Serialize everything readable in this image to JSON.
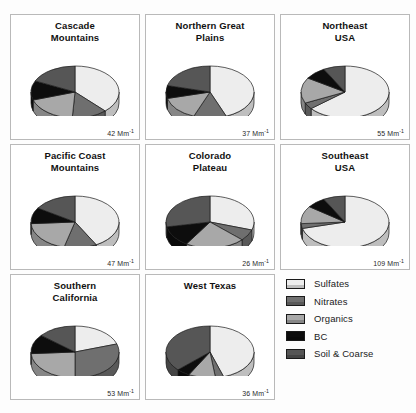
{
  "figure": {
    "kind": "small-multiples-3d-pie-grid",
    "background": "#fdfdfd",
    "columns": 3,
    "rows": 3,
    "unit_label": "Mm",
    "unit_exponent": "-1"
  },
  "legend": {
    "position": "bottom-right",
    "entries": [
      {
        "label": "Sulfates",
        "color": "#ededed"
      },
      {
        "label": "Nitrates",
        "color": "#6f6f6f"
      },
      {
        "label": "Organics",
        "color": "#a8a8a8"
      },
      {
        "label": "BC",
        "color": "#0d0d0d"
      },
      {
        "label": "Soil & Coarse",
        "color": "#565656"
      }
    ]
  },
  "chart_data": {
    "type": "pie",
    "title": "",
    "legend_position": "bottom-right",
    "series_names": [
      "Sulfates",
      "Nitrates",
      "Organics",
      "BC",
      "Soil & Coarse"
    ],
    "series_colors": [
      "#ededed",
      "#6f6f6f",
      "#a8a8a8",
      "#0d0d0d",
      "#565656"
    ],
    "value_unit": "Mm-1",
    "panels": [
      {
        "title_line1": "Cascade",
        "title_line2": "Mountains",
        "title": "Cascade Mountains",
        "value": 42,
        "value_label": "42 Mm",
        "value_exponent": "-1",
        "slices": [
          38,
          13,
          19,
          12,
          18
        ]
      },
      {
        "title_line1": "Northern Great",
        "title_line2": "Plains",
        "title": "Northern Great Plains",
        "value": 37,
        "value_label": "37 Mm",
        "value_exponent": "-1",
        "slices": [
          44,
          12,
          15,
          8,
          21
        ]
      },
      {
        "title_line1": "Northeast",
        "title_line2": "USA",
        "title": "Northeast USA",
        "value": 55,
        "value_label": "55 Mm",
        "value_exponent": "-1",
        "slices": [
          64,
          4,
          16,
          8,
          8
        ]
      },
      {
        "title_line1": "Pacific Coast",
        "title_line2": "Mountains",
        "title": "Pacific Coast Mountains",
        "value": 47,
        "value_label": "47 Mm",
        "value_exponent": "-1",
        "slices": [
          42,
          12,
          20,
          10,
          16
        ]
      },
      {
        "title_line1": "Colorado",
        "title_line2": "Plateau",
        "title": "Colorado Plateau",
        "value": 26,
        "value_label": "26 Mm",
        "value_exponent": "-1",
        "slices": [
          30,
          7,
          22,
          13,
          28
        ]
      },
      {
        "title_line1": "Southeast",
        "title_line2": "USA",
        "title": "Southeast USA",
        "value": 109,
        "value_label": "109 Mm",
        "value_exponent": "-1",
        "slices": [
          71,
          3,
          11,
          7,
          8
        ]
      },
      {
        "title_line1": "Southern",
        "title_line2": "California",
        "title": "Southern California",
        "value": 53,
        "value_label": "53 Mm",
        "value_exponent": "-1",
        "slices": [
          20,
          30,
          24,
          12,
          14
        ]
      },
      {
        "title_line1": "West Texas",
        "title_line2": "",
        "title": "West Texas",
        "value": 36,
        "value_label": "36 Mm",
        "value_exponent": "-1",
        "slices": [
          45,
          3,
          10,
          5,
          37
        ]
      }
    ]
  }
}
